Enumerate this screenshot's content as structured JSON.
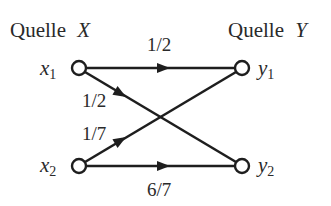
{
  "source_x": {
    "label": "Quelle",
    "var": "X"
  },
  "source_y": {
    "label": "Quelle",
    "var": "Y"
  },
  "nodes": {
    "x1": {
      "base": "x",
      "sub": "1"
    },
    "x2": {
      "base": "x",
      "sub": "2"
    },
    "y1": {
      "base": "y",
      "sub": "1"
    },
    "y2": {
      "base": "y",
      "sub": "2"
    }
  },
  "edges": [
    {
      "from": "x1",
      "to": "y1",
      "prob": "1/2"
    },
    {
      "from": "x1",
      "to": "y2",
      "prob": "1/2"
    },
    {
      "from": "x2",
      "to": "y1",
      "prob": "1/7"
    },
    {
      "from": "x2",
      "to": "y2",
      "prob": "6/7"
    }
  ],
  "colors": {
    "stroke": "#1e1e1e",
    "text": "#2a2a2a",
    "background": "#ffffff"
  }
}
